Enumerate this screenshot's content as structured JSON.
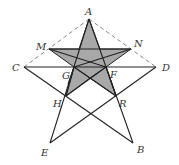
{
  "figure": {
    "points": {
      "A": {
        "label": "A"
      },
      "M": {
        "label": "M"
      },
      "N": {
        "label": "N"
      },
      "C": {
        "label": "C"
      },
      "D": {
        "label": "D"
      },
      "G": {
        "label": "G"
      },
      "F": {
        "label": "F"
      },
      "H": {
        "label": "H"
      },
      "R": {
        "label": "R"
      },
      "E": {
        "label": "E"
      },
      "B": {
        "label": "B"
      }
    },
    "solid_segments": [
      [
        "A",
        "E"
      ],
      [
        "A",
        "B"
      ],
      [
        "C",
        "B"
      ],
      [
        "D",
        "E"
      ],
      [
        "C",
        "D"
      ],
      [
        "M",
        "N"
      ]
    ],
    "dashed_segments": [
      [
        "C",
        "A"
      ],
      [
        "A",
        "D"
      ]
    ],
    "shaded_region": [
      "A",
      "N",
      "H",
      "M",
      "R"
    ],
    "colors": {
      "shade": "#a8a8a8",
      "line": "#222222",
      "dash": "#777777"
    }
  }
}
